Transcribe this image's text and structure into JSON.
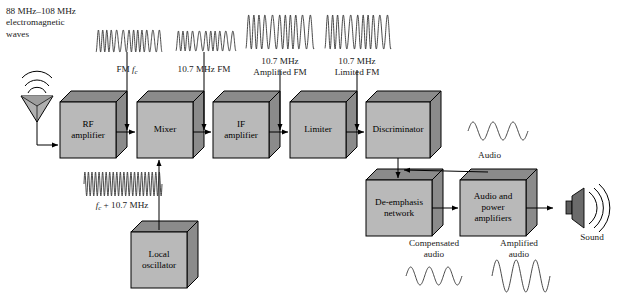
{
  "figure": {
    "background": "#ffffff",
    "block_face_color": "#b9b9b9",
    "block_shade_color": "#8b8b8b",
    "stroke_color": "#000000"
  },
  "source": {
    "line1": "88 MHz–108 MHz",
    "line2": "electromagnetic",
    "line3": "waves",
    "antenna_icon": "antenna-icon"
  },
  "blocks": [
    {
      "id": "rf-amplifier",
      "line1": "RF",
      "line2": "amplifier",
      "x": 60,
      "y": 102,
      "w": 56,
      "h": 56
    },
    {
      "id": "mixer",
      "line1": "Mixer",
      "line2": "",
      "x": 137,
      "y": 102,
      "w": 56,
      "h": 56
    },
    {
      "id": "if-amplifier",
      "line1": "IF",
      "line2": "amplifier",
      "x": 213,
      "y": 102,
      "w": 56,
      "h": 56
    },
    {
      "id": "limiter",
      "line1": "Limiter",
      "line2": "",
      "x": 290,
      "y": 102,
      "w": 56,
      "h": 56
    },
    {
      "id": "discriminator",
      "line1": "Discriminator",
      "line2": "",
      "x": 366,
      "y": 102,
      "w": 64,
      "h": 56
    },
    {
      "id": "local-oscillator",
      "line1": "Local",
      "line2": "oscillator",
      "x": 131,
      "y": 232,
      "w": 56,
      "h": 56
    },
    {
      "id": "de-emphasis",
      "line1": "De-emphasis",
      "line2": "network",
      "x": 366,
      "y": 180,
      "w": 66,
      "h": 56
    },
    {
      "id": "audio-amplifier",
      "line1": "Audio and",
      "line2": "power",
      "line3": "amplifiers",
      "x": 460,
      "y": 180,
      "w": 66,
      "h": 56
    }
  ],
  "waveform_labels": {
    "fm_fc": {
      "prefix": "FM ",
      "symbol": "f",
      "subscript": "c",
      "suffix": ""
    },
    "fm_107": {
      "line1": "10.7 MHz FM",
      "line2": ""
    },
    "amplified_fm": {
      "line1": "10.7 MHz",
      "line2": "Amplified FM"
    },
    "limited_fm": {
      "line1": "10.7 MHz",
      "line2": "Limited FM"
    },
    "oscillator_freq": {
      "symbol": "f",
      "subscript": "c",
      "suffix": " + 10.7 MHz"
    },
    "audio": {
      "text": "Audio"
    },
    "compensated": {
      "line1": "Compensated",
      "line2": "audio"
    },
    "amplified_audio": {
      "line1": "Amplified",
      "line2": "audio"
    },
    "sound": {
      "text": "Sound"
    }
  },
  "chart_data": {
    "type": "line",
    "series": [
      {
        "name": "FM fc",
        "kind": "fm-modulated",
        "cycles": 13,
        "amplitude": 11,
        "note": "broadcast carrier 88-108 MHz, frequency modulated"
      },
      {
        "name": "10.7 MHz FM",
        "kind": "fm-modulated",
        "cycles": 11,
        "amplitude": 10,
        "note": "down-converted IF"
      },
      {
        "name": "10.7 MHz Amplified FM",
        "kind": "fm-modulated",
        "cycles": 11,
        "amplitude": 17,
        "note": "amplified IF, larger amplitude"
      },
      {
        "name": "10.7 MHz Limited FM",
        "kind": "fm-modulated",
        "cycles": 11,
        "amplitude": 17,
        "note": "amplitude limited, constant envelope"
      },
      {
        "name": "fc + 10.7 MHz",
        "kind": "sine",
        "cycles": 22,
        "amplitude": 12,
        "note": "local oscillator, uniform high frequency"
      },
      {
        "name": "Audio",
        "kind": "sine",
        "cycles": 3,
        "amplitude": 9,
        "note": "demodulated audio out of discriminator"
      },
      {
        "name": "Compensated audio",
        "kind": "sine",
        "cycles": 3,
        "amplitude": 9,
        "note": "after de-emphasis network"
      },
      {
        "name": "Amplified audio",
        "kind": "sine",
        "cycles": 3,
        "amplitude": 16,
        "note": "after audio and power amplifiers"
      }
    ]
  }
}
